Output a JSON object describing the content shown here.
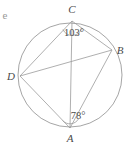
{
  "figure": {
    "stray_text": "e",
    "stroke_color": "#9b9b9b",
    "text_color": "#4a4a4a",
    "background_color": "#ffffff"
  },
  "circle": {
    "center_x": 70,
    "center_y": 75,
    "radius": 52
  },
  "vertices": [
    {
      "id": "A",
      "label": "A",
      "x": 70,
      "y": 128,
      "label_x": 70,
      "label_y": 142
    },
    {
      "id": "B",
      "label": "B",
      "x": 112,
      "y": 50,
      "label_x": 120,
      "label_y": 54
    },
    {
      "id": "C",
      "label": "C",
      "x": 72,
      "y": 21,
      "label_x": 72,
      "label_y": 13
    },
    {
      "id": "D",
      "label": "D",
      "x": 20,
      "y": 76,
      "label_x": 11,
      "label_y": 80
    }
  ],
  "edges": [
    {
      "from": "A",
      "to": "B"
    },
    {
      "from": "B",
      "to": "C"
    },
    {
      "from": "C",
      "to": "D"
    },
    {
      "from": "D",
      "to": "A"
    }
  ],
  "diagonals": [
    {
      "from": "A",
      "to": "C"
    },
    {
      "from": "B",
      "to": "D"
    }
  ],
  "angles": [
    {
      "at": "C",
      "value": 103,
      "label": "103°",
      "label_x": 74,
      "label_y": 36,
      "arc_path": "M 63.0 29.5 A 10 10 0 0 0 81.5 28.8"
    },
    {
      "at": "A",
      "value": 78,
      "label": "78°",
      "label_x": 78,
      "label_y": 119,
      "arc_path": "M 62.5 120.5 A 10 10 0 0 0 78.5 119.0"
    }
  ]
}
